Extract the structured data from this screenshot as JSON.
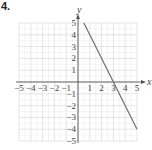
{
  "problem_number": "4.",
  "chart_data": {
    "type": "line",
    "title": "",
    "xlabel": "x",
    "ylabel": "y",
    "xlim": [
      -5,
      5
    ],
    "ylim": [
      -5,
      5
    ],
    "grid": true,
    "x_ticks": [
      "-5",
      "-4",
      "-3",
      "-2",
      "-1",
      "1",
      "2",
      "3",
      "4",
      "5"
    ],
    "y_ticks": [
      "5",
      "4",
      "3",
      "2",
      "1",
      "-1",
      "-2",
      "-3",
      "-4",
      "-5"
    ],
    "series": [
      {
        "name": "line",
        "equation": "y = -2x + 6",
        "x": [
          0.5,
          3,
          5
        ],
        "y": [
          5,
          0,
          -4
        ],
        "color": "#777777"
      }
    ]
  }
}
